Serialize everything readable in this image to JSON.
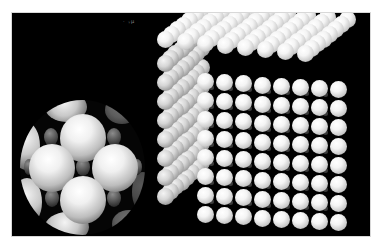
{
  "figure": {
    "background_color": "#000000",
    "artifact_text": "· ᵧµ",
    "left_model": {
      "label": "spherical cluster",
      "large_spheres": 5,
      "small_spheres_visible": 7,
      "sphere_color": "#f0f0f0",
      "interstitial_color": "#3c3c3c"
    },
    "right_model": {
      "label": "cubic lattice block",
      "grid_size": 8,
      "sphere_color": "#f4f4f4",
      "interstitial_color": "#3a3a3a"
    }
  }
}
